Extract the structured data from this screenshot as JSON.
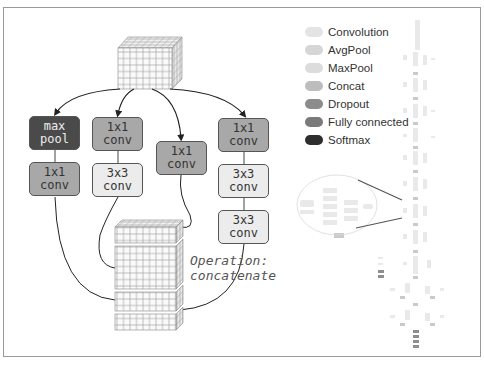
{
  "diagram": {
    "branches": [
      {
        "boxes": [
          {
            "label": "max\npool",
            "style": "dark"
          },
          {
            "label": "1x1\nconv",
            "style": "mid"
          }
        ]
      },
      {
        "boxes": [
          {
            "label": "1x1\nconv",
            "style": "mid"
          },
          {
            "label": "3x3\nconv",
            "style": "light"
          }
        ]
      },
      {
        "boxes": [
          {
            "label": "1x1\nconv",
            "style": "mid"
          }
        ]
      },
      {
        "boxes": [
          {
            "label": "1x1\nconv",
            "style": "mid"
          },
          {
            "label": "3x3\nconv",
            "style": "light"
          },
          {
            "label": "3x3\nconv",
            "style": "light"
          }
        ]
      }
    ],
    "annotation": "Operation:\nconcatenate"
  },
  "legend": {
    "items": [
      {
        "label": "Convolution",
        "color": "#e4e4e4"
      },
      {
        "label": "AvgPool",
        "color": "#d6d6d6"
      },
      {
        "label": "MaxPool",
        "color": "#dcdcdc"
      },
      {
        "label": "Concat",
        "color": "#bdbdbd"
      },
      {
        "label": "Dropout",
        "color": "#8c8c8c"
      },
      {
        "label": "Fully connected",
        "color": "#7a7a7a"
      },
      {
        "label": "Softmax",
        "color": "#2e2e2e"
      }
    ]
  },
  "colors": {
    "dark": "#4a4a4a",
    "mid": "#a8a8a8",
    "light": "#ececec",
    "grid": "#9a9a9a"
  }
}
